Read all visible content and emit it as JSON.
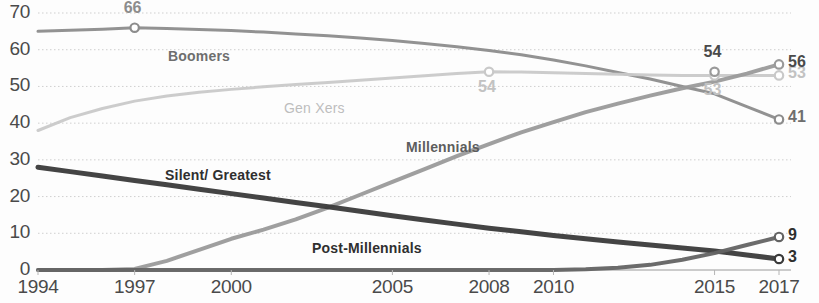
{
  "chart_data": {
    "type": "line",
    "title": "",
    "subtitle": "",
    "xlabel": "",
    "ylabel": "",
    "xlim": [
      1994,
      2017
    ],
    "ylim": [
      0,
      70
    ],
    "grid": true,
    "grid_style": "dotted-horizontal",
    "legend_position": "inline-series-labels",
    "x_ticks": [
      "1994",
      "1997",
      "2000",
      "2005",
      "2008",
      "2010",
      "2015",
      "2017"
    ],
    "x_tick_values": [
      1994,
      1997,
      2000,
      2005,
      2008,
      2010,
      2015,
      2017
    ],
    "y_ticks": [
      "0",
      "10",
      "20",
      "30",
      "40",
      "50",
      "60",
      "70"
    ],
    "y_tick_values": [
      0,
      10,
      20,
      30,
      40,
      50,
      60,
      70
    ],
    "x": [
      1994,
      1995,
      1996,
      1997,
      1998,
      1999,
      2000,
      2001,
      2002,
      2003,
      2004,
      2005,
      2006,
      2007,
      2008,
      2009,
      2010,
      2011,
      2012,
      2013,
      2014,
      2015,
      2016,
      2017
    ],
    "series": [
      {
        "name": "Boomers",
        "color": "#8c8c8c",
        "width": 3,
        "inline_label": "Boomers",
        "inline_label_color": "#6e6e6e",
        "inline_label_x": 168,
        "inline_label_y": 48,
        "end_value": 41,
        "end_label": "41",
        "end_label_color": "#6e6e6e",
        "markers": [
          {
            "x": 1997,
            "y": 66,
            "label": "66",
            "label_pos": "above",
            "label_color": "#8c8c8c"
          },
          {
            "x": 2017,
            "y": 41,
            "label": "41",
            "label_pos": "right",
            "label_color": "#6e6e6e"
          }
        ],
        "values": [
          65,
          65.3,
          65.6,
          66,
          65.8,
          65.5,
          65.2,
          64.8,
          64.3,
          63.8,
          63.2,
          62.5,
          61.7,
          60.8,
          59.8,
          58.6,
          57.2,
          55.6,
          53.8,
          52.0,
          50.0,
          48.0,
          44.5,
          41
        ]
      },
      {
        "name": "Gen Xers",
        "color": "#c9c9c9",
        "width": 3,
        "inline_label": "Gen Xers",
        "inline_label_color": "#bdbdbd",
        "inline_label_x": 284,
        "inline_label_y": 100,
        "end_value": 53,
        "end_label": "53",
        "end_label_color": "#c2c2c2",
        "markers": [
          {
            "x": 2008,
            "y": 54,
            "label": "54",
            "label_pos": "below",
            "label_color": "#c2c2c2"
          },
          {
            "x": 2015,
            "y": 53,
            "label": "53",
            "label_pos": "below",
            "label_color": "#c2c2c2"
          },
          {
            "x": 2017,
            "y": 53,
            "label": "53",
            "label_pos": "right",
            "label_color": "#c2c2c2"
          }
        ],
        "values": [
          38,
          41.5,
          44.0,
          46.0,
          47.4,
          48.4,
          49.2,
          49.9,
          50.5,
          51.1,
          51.7,
          52.3,
          52.9,
          53.5,
          54,
          53.9,
          53.7,
          53.5,
          53.3,
          53.1,
          53.0,
          53,
          53,
          53
        ]
      },
      {
        "name": "Millennials",
        "color": "#9a9a9a",
        "width": 4,
        "inline_label": "Millennials",
        "inline_label_color": "#5d5d5d",
        "inline_label_x": 406,
        "inline_label_y": 139,
        "end_value": 56,
        "end_label": "56",
        "end_label_color": "#4a4a4a",
        "markers": [
          {
            "x": 2015,
            "y": 54,
            "label": "54",
            "label_pos": "above",
            "label_color": "#4a4a4a"
          },
          {
            "x": 2017,
            "y": 56,
            "label": "56",
            "label_pos": "right",
            "label_color": "#4a4a4a"
          }
        ],
        "values": [
          0,
          0,
          0,
          0.3,
          2.5,
          5.5,
          8.5,
          11.0,
          13.8,
          17.0,
          20.5,
          24.0,
          27.5,
          31.0,
          34.3,
          37.5,
          40.3,
          43.0,
          45.3,
          47.5,
          49.5,
          51.3,
          53.5,
          56
        ]
      },
      {
        "name": "Silent/ Greatest",
        "color": "#3a3a3a",
        "width": 5,
        "inline_label": "Silent/ Greatest",
        "inline_label_color": "#2f2f2f",
        "inline_label_x": 165,
        "inline_label_y": 167,
        "end_value": 3,
        "end_label": "3",
        "end_label_color": "#2f2f2f",
        "markers": [
          {
            "x": 2017,
            "y": 3,
            "label": "3",
            "label_pos": "right",
            "label_color": "#2f2f2f"
          }
        ],
        "values": [
          28,
          26.8,
          25.6,
          24.4,
          23.2,
          22.0,
          20.8,
          19.6,
          18.4,
          17.2,
          16.0,
          14.8,
          13.6,
          12.5,
          11.4,
          10.4,
          9.4,
          8.5,
          7.6,
          6.8,
          6.0,
          5.2,
          4.1,
          3
        ]
      },
      {
        "name": "Post-Millennials",
        "color": "#636363",
        "width": 4,
        "inline_label": "Post-Millennials",
        "inline_label_color": "#2f2f2f",
        "inline_label_x": 312,
        "inline_label_y": 240,
        "end_value": 9,
        "end_label": "9",
        "end_label_color": "#2f2f2f",
        "markers": [
          {
            "x": 2017,
            "y": 9,
            "label": "9",
            "label_pos": "right",
            "label_color": "#2f2f2f"
          }
        ],
        "values": [
          0,
          0,
          0,
          0,
          0,
          0,
          0,
          0,
          0,
          0,
          0,
          0,
          0,
          0,
          0,
          0,
          0,
          0.2,
          0.6,
          1.4,
          2.8,
          4.6,
          6.8,
          9
        ]
      }
    ]
  },
  "axes": {
    "y_tick_labels": [
      "70",
      "60",
      "50",
      "40",
      "30",
      "20",
      "10",
      "0"
    ],
    "x_tick_labels": [
      "1994",
      "1997",
      "2000",
      "2005",
      "2008",
      "2010",
      "2015",
      "2017"
    ]
  }
}
